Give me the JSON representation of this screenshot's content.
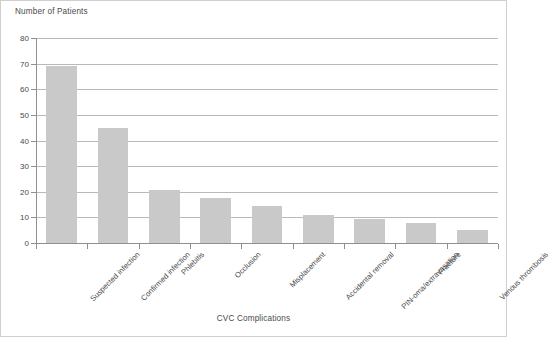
{
  "chart_data": {
    "type": "bar",
    "title": "",
    "xlabel": "CVC Complications",
    "ylabel": "Number of Patients",
    "categories": [
      "Suspected infection",
      "Confirmed infection",
      "Phlebitis",
      "Occlusion",
      "Misplacement",
      "Accidental removal",
      "PIN-oma/extravasation",
      "Fracture",
      "Venous thrombosis"
    ],
    "values": [
      69,
      45,
      20.5,
      17.5,
      14.5,
      11,
      9.5,
      8,
      5
    ],
    "ylim": [
      0,
      80
    ],
    "ytick_labels": [
      "0",
      "10",
      "20",
      "30",
      "40",
      "50",
      "60",
      "70",
      "80"
    ],
    "ytick_values": [
      0,
      10,
      20,
      30,
      40,
      50,
      60,
      70,
      80
    ],
    "grid": true,
    "grid_axis": "y",
    "legend": false,
    "legend_position": "none",
    "bar_color": "#c9c9c9",
    "axis_color": "#8f8f8f",
    "grid_color": "#b9b9b9",
    "text_color": "#4a4a4a",
    "background": "#ffffff",
    "xtick_label_rotation": -45
  }
}
